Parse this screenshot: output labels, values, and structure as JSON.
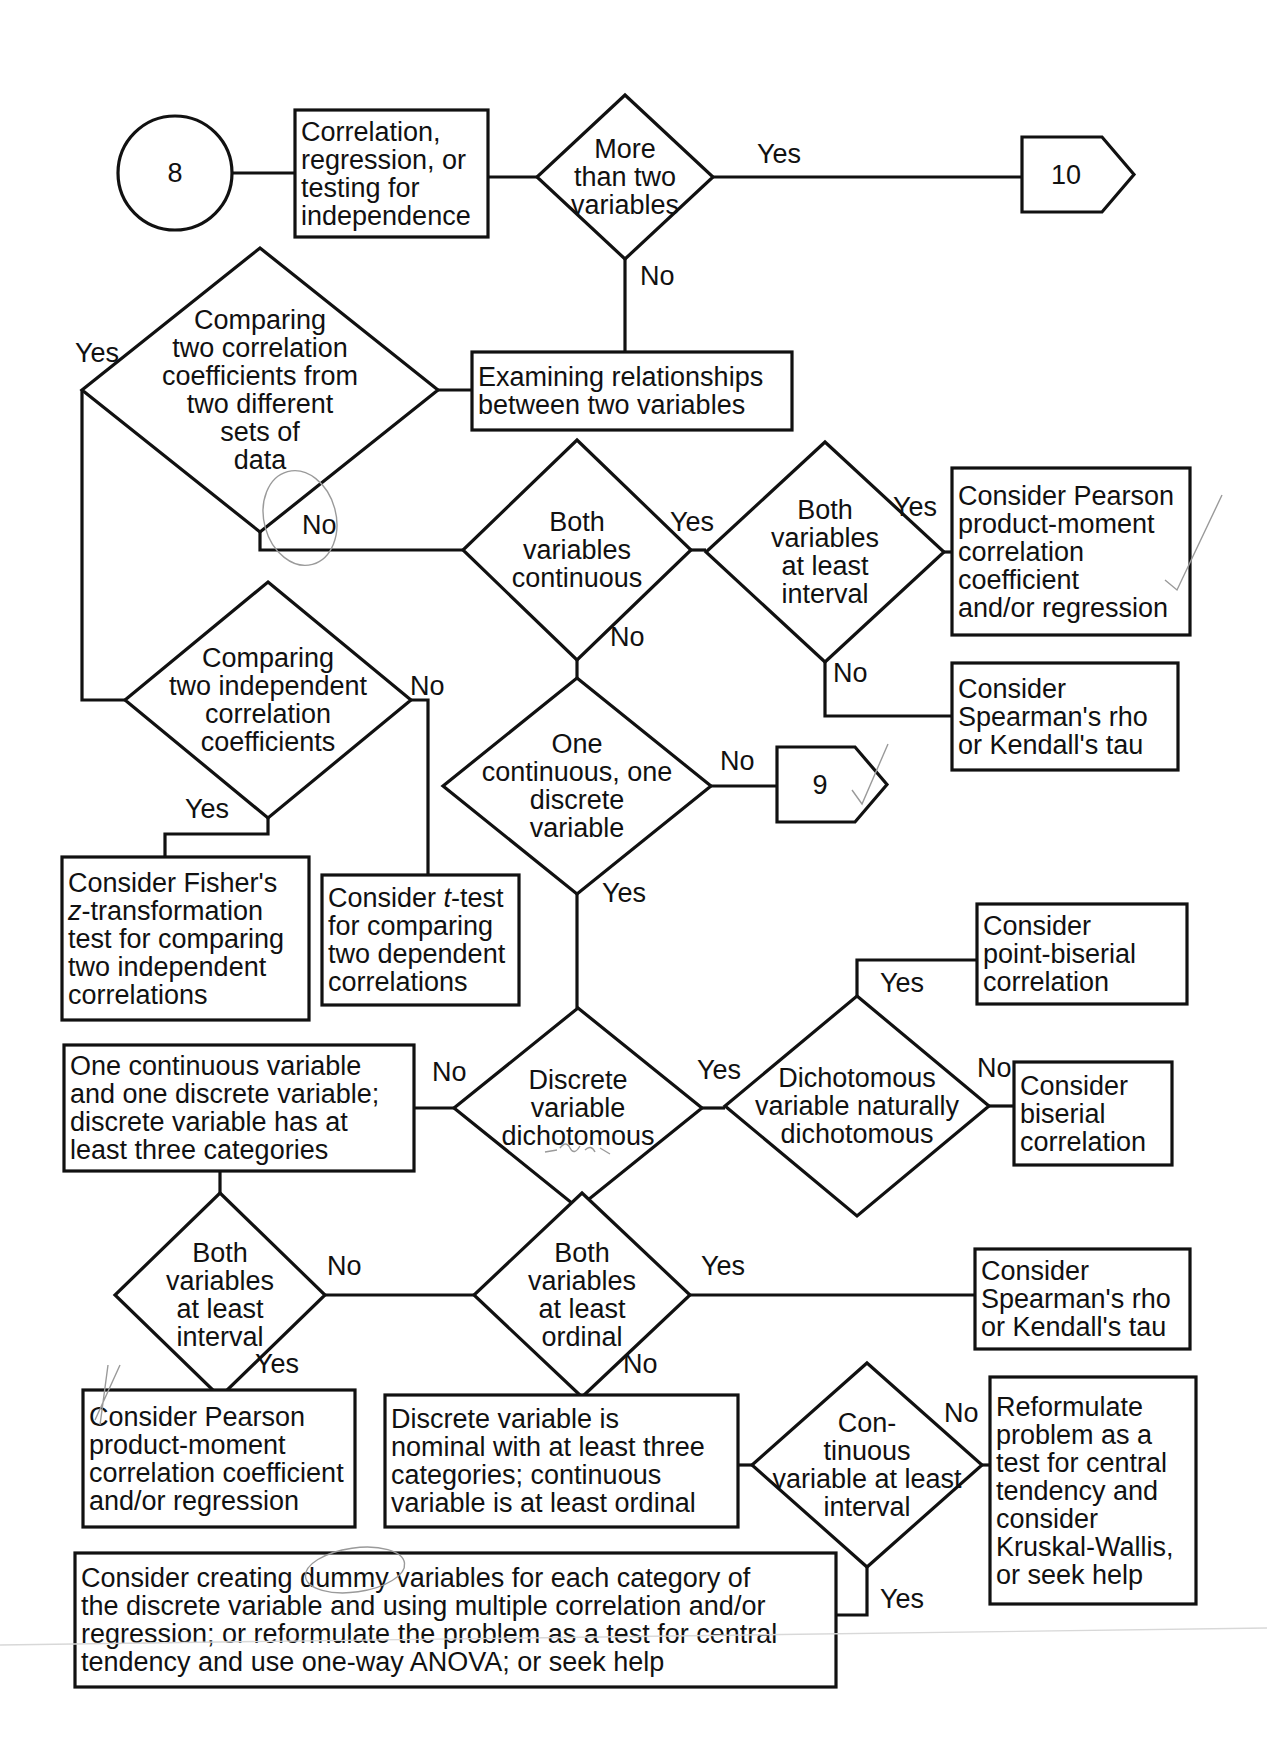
{
  "diagram": {
    "nodes": [
      {
        "id": "start-8",
        "type": "circle",
        "cx": 175,
        "cy": 173,
        "r": 57,
        "lines": [
          "8"
        ],
        "name": "start-connector-8"
      },
      {
        "id": "corr",
        "type": "box",
        "x": 295,
        "y": 110,
        "w": 193,
        "h": 127,
        "align": "left",
        "lines": [
          "Correlation,",
          "regression, or",
          "testing for",
          "independence"
        ],
        "name": "box-correlation-regression"
      },
      {
        "id": "d-more-two",
        "type": "diamond",
        "cx": 625,
        "cy": 177,
        "hw": 88,
        "hh": 82,
        "lines": [
          "More",
          "than two",
          "variables"
        ],
        "name": "decision-more-than-two-variables"
      },
      {
        "id": "to-10",
        "type": "offpage",
        "x": 1022,
        "y": 137,
        "w": 112,
        "h": 75,
        "lines": [
          "10"
        ],
        "name": "offpage-connector-10"
      },
      {
        "id": "examining",
        "type": "box",
        "x": 472,
        "y": 352,
        "w": 320,
        "h": 78,
        "align": "left",
        "lines": [
          "Examining relationships",
          "between two variables"
        ],
        "name": "box-examining-relationships"
      },
      {
        "id": "d-compare-two-sets",
        "type": "diamond",
        "cx": 260,
        "cy": 390,
        "hw": 178,
        "hh": 142,
        "lines": [
          "Comparing",
          "two correlation",
          "coefficients from",
          "two different",
          "sets of",
          "data"
        ],
        "name": "decision-comparing-two-coefficients-different-sets"
      },
      {
        "id": "d-both-continuous",
        "type": "diamond",
        "cx": 577,
        "cy": 550,
        "hw": 114,
        "hh": 110,
        "lines": [
          "Both",
          "variables",
          "continuous"
        ],
        "name": "decision-both-variables-continuous"
      },
      {
        "id": "d-both-interval-1",
        "type": "diamond",
        "cx": 825,
        "cy": 552,
        "hw": 119,
        "hh": 110,
        "lines": [
          "Both",
          "variables",
          "at least",
          "interval"
        ],
        "name": "decision-both-variables-at-least-interval-top"
      },
      {
        "id": "pearson-1",
        "type": "box",
        "x": 952,
        "y": 468,
        "w": 238,
        "h": 167,
        "align": "left",
        "lines": [
          "Consider Pearson",
          "product-moment",
          "correlation",
          "coefficient",
          "and/or regression"
        ],
        "name": "box-consider-pearson-top"
      },
      {
        "id": "spearman-1",
        "type": "box",
        "x": 952,
        "y": 663,
        "w": 226,
        "h": 107,
        "align": "left",
        "lines": [
          "Consider",
          "Spearman's rho",
          "or Kendall's tau"
        ],
        "name": "box-consider-spearman-top"
      },
      {
        "id": "d-compare-independent",
        "type": "diamond",
        "cx": 268,
        "cy": 700,
        "hw": 143,
        "hh": 118,
        "lines": [
          "Comparing",
          "two independent",
          "correlation",
          "coefficients"
        ],
        "name": "decision-comparing-two-independent-coefficients"
      },
      {
        "id": "d-one-cont-one-disc",
        "type": "diamond",
        "cx": 577,
        "cy": 786,
        "hw": 134,
        "hh": 108,
        "lines": [
          "One",
          "continuous, one",
          "discrete",
          "variable"
        ],
        "name": "decision-one-continuous-one-discrete"
      },
      {
        "id": "to-9",
        "type": "offpage",
        "x": 777,
        "y": 747,
        "w": 110,
        "h": 75,
        "lines": [
          "9"
        ],
        "name": "offpage-connector-9"
      },
      {
        "id": "fisher",
        "type": "box",
        "x": 62,
        "y": 857,
        "w": 247,
        "h": 163,
        "align": "left",
        "italicFirst": true,
        "lines": [
          "Consider Fisher's",
          "z-transformation",
          "test for comparing",
          "two independent",
          "correlations"
        ],
        "name": "box-consider-fisher-z"
      },
      {
        "id": "ttest",
        "type": "box",
        "x": 322,
        "y": 875,
        "w": 197,
        "h": 130,
        "align": "left",
        "lines": [
          "Consider t-test",
          "for comparing",
          "two dependent",
          "correlations"
        ],
        "name": "box-consider-t-test"
      },
      {
        "id": "point-biserial",
        "type": "box",
        "x": 977,
        "y": 904,
        "w": 210,
        "h": 100,
        "align": "left",
        "lines": [
          "Consider",
          "point-biserial",
          "correlation"
        ],
        "name": "box-consider-point-biserial"
      },
      {
        "id": "one-cont-three-cat",
        "type": "box",
        "x": 64,
        "y": 1045,
        "w": 350,
        "h": 126,
        "align": "left",
        "lines": [
          "One continuous variable",
          "and one discrete variable;",
          "discrete variable has at",
          "least three categories"
        ],
        "name": "box-one-continuous-three-categories"
      },
      {
        "id": "d-discrete-dichotomous",
        "type": "diamond",
        "cx": 578,
        "cy": 1108,
        "hw": 124,
        "hh": 100,
        "lines": [
          "Discrete",
          "variable",
          "dichotomous"
        ],
        "name": "decision-discrete-variable-dichotomous"
      },
      {
        "id": "d-naturally-dichotomous",
        "type": "diamond",
        "cx": 857,
        "cy": 1106,
        "hw": 132,
        "hh": 110,
        "lines": [
          "Dichotomous",
          "variable naturally",
          "dichotomous"
        ],
        "name": "decision-naturally-dichotomous"
      },
      {
        "id": "biserial",
        "type": "box",
        "x": 1014,
        "y": 1062,
        "w": 158,
        "h": 103,
        "align": "left",
        "lines": [
          "Consider",
          "biserial",
          "correlation"
        ],
        "name": "box-consider-biserial"
      },
      {
        "id": "d-both-interval-2",
        "type": "diamond",
        "cx": 220,
        "cy": 1295,
        "hw": 105,
        "hh": 102,
        "lines": [
          "Both",
          "variables",
          "at least",
          "interval"
        ],
        "name": "decision-both-variables-at-least-interval-bottom"
      },
      {
        "id": "d-both-ordinal",
        "type": "diamond",
        "cx": 582,
        "cy": 1295,
        "hw": 108,
        "hh": 102,
        "lines": [
          "Both",
          "variables",
          "at least",
          "ordinal"
        ],
        "name": "decision-both-variables-at-least-ordinal"
      },
      {
        "id": "spearman-2",
        "type": "box",
        "x": 975,
        "y": 1249,
        "w": 215,
        "h": 100,
        "align": "left",
        "lines": [
          "Consider",
          "Spearman's rho",
          "or Kendall's tau"
        ],
        "name": "box-consider-spearman-bottom"
      },
      {
        "id": "pearson-2",
        "type": "box",
        "x": 83,
        "y": 1390,
        "w": 272,
        "h": 137,
        "align": "left",
        "lines": [
          "Consider Pearson",
          "product-moment",
          "correlation coefficient",
          "and/or regression"
        ],
        "name": "box-consider-pearson-bottom"
      },
      {
        "id": "nominal",
        "type": "box",
        "x": 385,
        "y": 1395,
        "w": 353,
        "h": 132,
        "align": "left",
        "lines": [
          "Discrete variable is",
          "nominal with at least three",
          "categories; continuous",
          "variable is at least ordinal"
        ],
        "name": "box-discrete-nominal"
      },
      {
        "id": "d-cont-interval",
        "type": "diamond",
        "cx": 867,
        "cy": 1465,
        "hw": 115,
        "hh": 102,
        "lines": [
          "Con-",
          "tinuous",
          "variable at least",
          "interval"
        ],
        "name": "decision-continuous-variable-at-least-interval"
      },
      {
        "id": "reformulate",
        "type": "box",
        "x": 990,
        "y": 1377,
        "w": 206,
        "h": 227,
        "align": "left",
        "lines": [
          "Reformulate",
          "problem as a",
          "test for central",
          "tendency and",
          "consider",
          "Kruskal-Wallis,",
          "or seek help"
        ],
        "name": "box-reformulate-kruskal-wallis"
      },
      {
        "id": "dummy",
        "type": "box",
        "x": 75,
        "y": 1553,
        "w": 761,
        "h": 134,
        "align": "left",
        "lines": [
          "Consider creating dummy variables for each category of",
          "the discrete variable and using multiple correlation and/or",
          "regression; or reformulate the problem as a test for central",
          "tendency and use one-way ANOVA; or seek help"
        ],
        "name": "box-consider-dummy-variables"
      }
    ],
    "edges": [
      {
        "points": [
          [
            232,
            173
          ],
          [
            295,
            173
          ]
        ]
      },
      {
        "points": [
          [
            488,
            177
          ],
          [
            537,
            177
          ]
        ]
      },
      {
        "points": [
          [
            713,
            177
          ],
          [
            1022,
            177
          ]
        ]
      },
      {
        "points": [
          [
            625,
            259
          ],
          [
            625,
            352
          ]
        ]
      },
      {
        "points": [
          [
            438,
            390
          ],
          [
            472,
            390
          ]
        ]
      },
      {
        "points": [
          [
            82,
            390
          ],
          [
            82,
            700
          ],
          [
            125,
            700
          ]
        ]
      },
      {
        "points": [
          [
            260,
            532
          ],
          [
            260,
            550
          ],
          [
            463,
            550
          ]
        ]
      },
      {
        "points": [
          [
            691,
            550
          ],
          [
            706,
            550
          ]
        ]
      },
      {
        "points": [
          [
            944,
            552
          ],
          [
            952,
            552
          ]
        ]
      },
      {
        "points": [
          [
            825,
            662
          ],
          [
            825,
            716
          ],
          [
            952,
            716
          ]
        ]
      },
      {
        "points": [
          [
            577,
            660
          ],
          [
            577,
            678
          ]
        ]
      },
      {
        "points": [
          [
            711,
            786
          ],
          [
            777,
            786
          ]
        ]
      },
      {
        "points": [
          [
            268,
            818
          ],
          [
            268,
            834
          ],
          [
            165,
            834
          ],
          [
            165,
            857
          ]
        ]
      },
      {
        "points": [
          [
            411,
            700
          ],
          [
            428,
            700
          ],
          [
            428,
            875
          ]
        ]
      },
      {
        "points": [
          [
            577,
            894
          ],
          [
            577,
            1008
          ]
        ]
      },
      {
        "points": [
          [
            414,
            1108
          ],
          [
            454,
            1108
          ]
        ]
      },
      {
        "points": [
          [
            702,
            1108
          ],
          [
            725,
            1108
          ]
        ]
      },
      {
        "points": [
          [
            857,
            996
          ],
          [
            857,
            960
          ],
          [
            977,
            960
          ]
        ]
      },
      {
        "points": [
          [
            989,
            1106
          ],
          [
            1014,
            1106
          ]
        ]
      },
      {
        "points": [
          [
            220,
            1171
          ],
          [
            220,
            1193
          ]
        ]
      },
      {
        "points": [
          [
            325,
            1295
          ],
          [
            474,
            1295
          ]
        ]
      },
      {
        "points": [
          [
            690,
            1295
          ],
          [
            975,
            1295
          ]
        ]
      },
      {
        "points": [
          [
            220,
            1397
          ],
          [
            220,
            1390
          ]
        ]
      },
      {
        "points": [
          [
            582,
            1397
          ],
          [
            582,
            1395
          ]
        ]
      },
      {
        "points": [
          [
            738,
            1465
          ],
          [
            752,
            1465
          ]
        ]
      },
      {
        "points": [
          [
            982,
            1465
          ],
          [
            990,
            1465
          ]
        ]
      },
      {
        "points": [
          [
            867,
            1567
          ],
          [
            867,
            1615
          ],
          [
            836,
            1615
          ]
        ]
      }
    ],
    "labels": [
      {
        "text": "Yes",
        "x": 757,
        "y": 163,
        "name": "label-yes-more-than-two"
      },
      {
        "text": "No",
        "x": 640,
        "y": 285,
        "name": "label-no-more-than-two"
      },
      {
        "text": "Yes",
        "x": 75,
        "y": 362,
        "name": "label-yes-compare-sets"
      },
      {
        "text": "No",
        "x": 302,
        "y": 534,
        "name": "label-no-compare-sets"
      },
      {
        "text": "Yes",
        "x": 670,
        "y": 531,
        "name": "label-yes-both-continuous"
      },
      {
        "text": "Yes",
        "x": 893,
        "y": 516,
        "name": "label-yes-interval-top"
      },
      {
        "text": "No",
        "x": 610,
        "y": 646,
        "name": "label-no-both-continuous"
      },
      {
        "text": "No",
        "x": 833,
        "y": 682,
        "name": "label-no-interval-top"
      },
      {
        "text": "No",
        "x": 410,
        "y": 695,
        "name": "label-no-compare-independent"
      },
      {
        "text": "Yes",
        "x": 185,
        "y": 818,
        "name": "label-yes-compare-independent"
      },
      {
        "text": "No",
        "x": 720,
        "y": 770,
        "name": "label-no-one-cont-one-disc"
      },
      {
        "text": "Yes",
        "x": 602,
        "y": 902,
        "name": "label-yes-one-cont-one-disc"
      },
      {
        "text": "Yes",
        "x": 880,
        "y": 992,
        "name": "label-yes-naturally"
      },
      {
        "text": "No",
        "x": 432,
        "y": 1081,
        "name": "label-no-discrete-dichotomous"
      },
      {
        "text": "Yes",
        "x": 697,
        "y": 1079,
        "name": "label-yes-discrete-dichotomous"
      },
      {
        "text": "No",
        "x": 977,
        "y": 1077,
        "name": "label-no-naturally"
      },
      {
        "text": "No",
        "x": 327,
        "y": 1275,
        "name": "label-no-interval-bottom"
      },
      {
        "text": "Yes",
        "x": 701,
        "y": 1275,
        "name": "label-yes-ordinal"
      },
      {
        "text": "Yes",
        "x": 255,
        "y": 1373,
        "name": "label-yes-interval-bottom"
      },
      {
        "text": "No",
        "x": 623,
        "y": 1373,
        "name": "label-no-ordinal"
      },
      {
        "text": "No",
        "x": 944,
        "y": 1422,
        "name": "label-no-cont-interval"
      },
      {
        "text": "Yes",
        "x": 880,
        "y": 1608,
        "name": "label-yes-cont-interval"
      }
    ]
  }
}
